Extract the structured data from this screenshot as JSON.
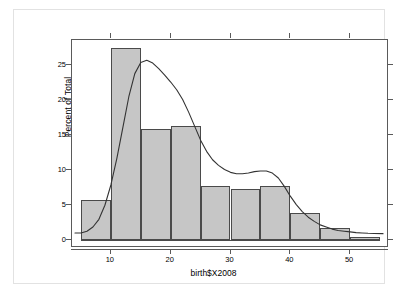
{
  "figure": {
    "x_label": "birth$X2008",
    "y_label": "Percent of Total",
    "bottom_caption": ""
  },
  "chart_data": {
    "type": "bar",
    "title": "",
    "subtitle": "",
    "xlabel": "birth$X2008",
    "ylabel": "Percent of Total",
    "xlim": [
      3.5,
      56.5
    ],
    "ylim": [
      -1.2,
      28.5
    ],
    "grid": false,
    "legend": null,
    "xticks": [
      10,
      20,
      30,
      40,
      50
    ],
    "xtick_labels": [
      "10",
      "20",
      "30",
      "40",
      "50"
    ],
    "yticks": [
      0,
      5,
      10,
      15,
      20,
      25
    ],
    "ytick_labels": [
      "0",
      "5",
      "10",
      "15",
      "20",
      "25"
    ],
    "bin_width": 5,
    "bin_edges": [
      5,
      10,
      15,
      20,
      25,
      30,
      35,
      40,
      45,
      50,
      55
    ],
    "categories": [
      "5-10",
      "10-15",
      "15-20",
      "20-25",
      "25-30",
      "30-35",
      "35-40",
      "40-45",
      "45-50",
      "50-55"
    ],
    "values": [
      5.6,
      27.3,
      15.8,
      16.2,
      7.6,
      7.2,
      7.6,
      3.8,
      1.6,
      0.4
    ],
    "bar_fill": "#c6c6c6",
    "bar_edge": "#4a4a4a",
    "overlay": {
      "type": "line",
      "name": "density",
      "color": "#333333",
      "x": [
        4.0,
        5.0,
        6.0,
        7.0,
        8.0,
        9.0,
        10.0,
        11.0,
        12.0,
        13.0,
        14.0,
        15.0,
        16.0,
        17.0,
        18.0,
        19.0,
        20.0,
        21.0,
        22.0,
        23.0,
        24.0,
        25.0,
        26.0,
        27.0,
        28.0,
        29.0,
        30.0,
        31.0,
        32.0,
        33.0,
        34.0,
        35.0,
        36.0,
        37.0,
        38.0,
        39.0,
        40.0,
        41.0,
        42.0,
        43.0,
        44.0,
        45.0,
        46.0,
        47.0,
        48.0,
        49.0,
        50.0,
        51.0,
        52.0,
        53.0,
        54.0,
        55.5
      ],
      "y": [
        0.95,
        0.95,
        1.2,
        1.8,
        2.9,
        4.9,
        7.8,
        11.6,
        16.0,
        20.4,
        23.7,
        25.3,
        25.6,
        25.2,
        24.4,
        23.5,
        22.5,
        21.4,
        20.0,
        18.2,
        16.2,
        14.2,
        12.6,
        11.4,
        10.6,
        10.0,
        9.6,
        9.4,
        9.4,
        9.5,
        9.7,
        9.8,
        9.8,
        9.5,
        8.8,
        7.6,
        6.2,
        5.0,
        4.0,
        3.2,
        2.6,
        2.1,
        1.8,
        1.5,
        1.3,
        1.2,
        1.1,
        1.0,
        0.95,
        0.9,
        0.88,
        0.85
      ]
    }
  }
}
